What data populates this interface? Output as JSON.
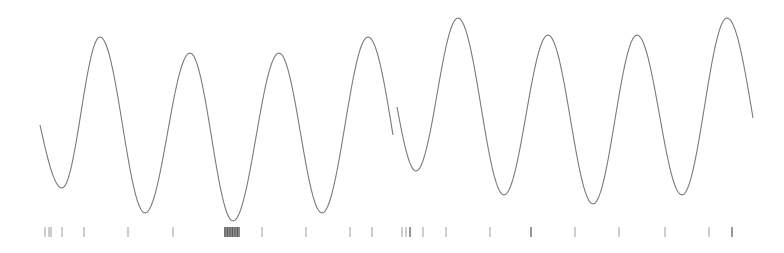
{
  "chart_data": {
    "type": "line",
    "title": "",
    "xlabel": "",
    "ylabel": "",
    "grid": false,
    "legend": null,
    "series": [
      {
        "name": "trace-1",
        "points": [
          [
            40,
            125
          ],
          [
            62,
            188
          ],
          [
            100,
            37
          ],
          [
            145,
            213
          ],
          [
            190,
            53
          ],
          [
            233,
            221
          ],
          [
            279,
            53
          ],
          [
            322,
            213
          ],
          [
            368,
            37
          ],
          [
            393,
            135
          ]
        ]
      },
      {
        "name": "trace-2",
        "points": [
          [
            397,
            107
          ],
          [
            416,
            171
          ],
          [
            458,
            18
          ],
          [
            504,
            195
          ],
          [
            548,
            35
          ],
          [
            593,
            204
          ],
          [
            637,
            35
          ],
          [
            682,
            195
          ],
          [
            727,
            18
          ],
          [
            753,
            118
          ]
        ]
      }
    ],
    "rug_marks": {
      "y_top": 227,
      "y_bottom": 237,
      "group_1": [
        45,
        49,
        51,
        62,
        84,
        128,
        173,
        262,
        306,
        350,
        372
      ],
      "group_1_dense_block": {
        "x_start": 224,
        "x_end": 240
      },
      "group_2": [
        402,
        406,
        410,
        423,
        446,
        490,
        531,
        575,
        619,
        665,
        709,
        732
      ]
    },
    "colors": {
      "curve": "#7a7a7a",
      "ticks": "#9a9a9a",
      "background": "#ffffff"
    }
  }
}
